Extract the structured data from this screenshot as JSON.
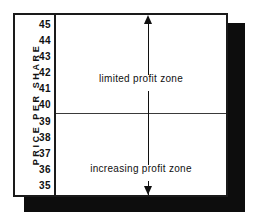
{
  "figure": {
    "axis_title": "PRICE PER SHARE",
    "upper_zone_label": "limited profit zone",
    "lower_zone_label": "increasing profit zone"
  },
  "chart_data": {
    "type": "diagram",
    "title": "",
    "xlabel": "",
    "ylabel": "PRICE PER SHARE",
    "ylim": [
      35,
      45
    ],
    "y_ticks": [
      45,
      44,
      43,
      42,
      41,
      40,
      39,
      38,
      37,
      36,
      35
    ],
    "grid": false,
    "legend": "none",
    "annotations": [
      {
        "name": "limited-profit-zone",
        "text": "limited profit zone",
        "y_range": [
          39.5,
          45
        ],
        "marker": "double-headed vertical arrow"
      },
      {
        "name": "increasing-profit-zone",
        "text": "increasing profit zone",
        "y_range": [
          35,
          39.5
        ],
        "marker": "double-headed vertical arrow"
      }
    ],
    "divider": {
      "name": "zone-boundary",
      "value": 39.5,
      "orientation": "horizontal",
      "description": "boundary line between the two profit zones, drawn between the 40 and 39 tick labels"
    },
    "colors": {
      "ink": "#101010",
      "frame": "#1a1a1a",
      "shadow": "#0d0d0d",
      "background": "#ffffff"
    }
  }
}
